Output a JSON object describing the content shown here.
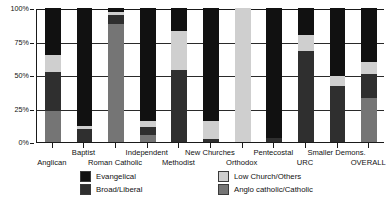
{
  "chart_data": {
    "type": "bar",
    "title": "",
    "subtitle": "",
    "xlabel": "",
    "ylabel": "",
    "stacked": true,
    "orientation": "vertical",
    "ylim": [
      0,
      100
    ],
    "yticks": [
      "0%",
      "25%",
      "50%",
      "75%",
      "100%"
    ],
    "ytick_values": [
      0,
      25,
      50,
      75,
      100
    ],
    "grid": true,
    "grid_axis": "y",
    "legend_position": "bottom",
    "categories": [
      "Anglican",
      "Baptist",
      "Roman Catholic",
      "Independent",
      "Methodist",
      "New Churches",
      "Orthodox",
      "Pentecostal",
      "URC",
      "Smaller Demons.",
      "OVERALL"
    ],
    "series": [
      {
        "name": "Anglo catholic/Catholic",
        "color": "#757575",
        "values": [
          23,
          0,
          88,
          5,
          0,
          0,
          0,
          0,
          0,
          0,
          33
        ]
      },
      {
        "name": "Broad/Liberal",
        "color": "#2f2f2f",
        "values": [
          29,
          10,
          7,
          6,
          54,
          2,
          0,
          3,
          68,
          42,
          18
        ]
      },
      {
        "name": "Low Church/Others",
        "color": "#cfcfcf",
        "values": [
          13,
          2,
          2,
          5,
          29,
          14,
          100,
          0,
          12,
          7,
          9
        ]
      },
      {
        "name": "Evangelical",
        "color": "#111111",
        "values": [
          35,
          88,
          3,
          84,
          17,
          84,
          0,
          97,
          20,
          51,
          40
        ]
      }
    ],
    "legend_entries": [
      {
        "label": "Evangelical",
        "color": "#111111"
      },
      {
        "label": "Low Church/Others",
        "color": "#cfcfcf"
      },
      {
        "label": "Broad/Liberal",
        "color": "#2f2f2f"
      },
      {
        "label": "Anglo catholic/Catholic",
        "color": "#757575"
      }
    ],
    "category_label_rows": [
      1,
      0,
      1,
      0,
      1,
      0,
      1,
      0,
      1,
      0,
      1
    ]
  }
}
